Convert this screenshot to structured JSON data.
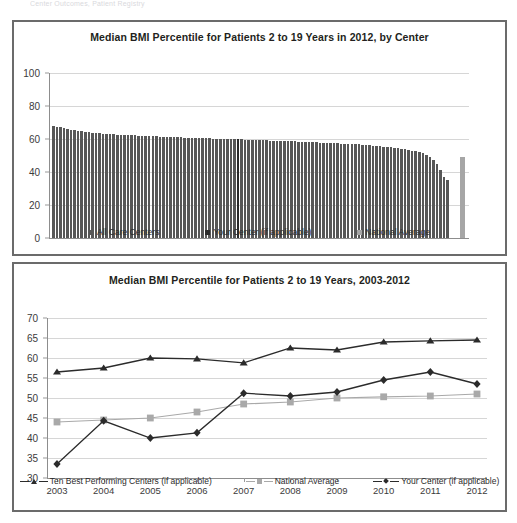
{
  "page": {
    "cut_header_text": "Center Outcomes, Patient Registry"
  },
  "panels": {
    "top": {
      "title": "Median BMI Percentile for Patients 2 to 19 Years in 2012, by Center",
      "legend": [
        {
          "label": "All Care Centers",
          "color": "#575757",
          "key": "all"
        },
        {
          "label": "Your Center (if applicable)",
          "color": "#2a2a2a",
          "key": "you"
        },
        {
          "label": "National Average",
          "color": "#a6a6a6",
          "key": "natl"
        }
      ]
    },
    "bottom": {
      "title": "Median BMI Percentile for Patients 2 to 19 Years, 2003-2012",
      "legend": [
        {
          "label": "Ten Best Performing Centers (if applicable)",
          "marker": "triangle",
          "color": "#2b2b2b"
        },
        {
          "label": "National Average",
          "marker": "square",
          "color": "#a9a9a9"
        },
        {
          "label": "Your Center (if applicable)",
          "marker": "diamond",
          "color": "#2b2b2b"
        }
      ]
    }
  },
  "chart_data": [
    {
      "type": "bar",
      "title": "Median BMI Percentile for Patients 2 to 19 Years in 2012, by Center",
      "xlabel": "",
      "ylabel": "",
      "ylim": [
        0,
        100
      ],
      "yticks": [
        0,
        20,
        40,
        60,
        80,
        100
      ],
      "grid": true,
      "legend_position": "bottom",
      "series": [
        {
          "name": "All Care Centers",
          "color": "#575757"
        },
        {
          "name": "Your Center (if applicable)",
          "color": "#2a2a2a"
        },
        {
          "name": "National Average",
          "color": "#a6a6a6"
        }
      ],
      "your_center_index": 52,
      "national_average_value": 49,
      "values": [
        68,
        67.5,
        67,
        66.5,
        66,
        65.5,
        65.2,
        65,
        64.6,
        64.3,
        64,
        63.8,
        63.5,
        63.4,
        63.2,
        63,
        62.9,
        62.8,
        62.7,
        62.6,
        62.5,
        62.4,
        62.3,
        62.2,
        62.1,
        62,
        61.9,
        61.8,
        61.7,
        61.6,
        61.5,
        61.4,
        61.3,
        61.2,
        61.1,
        61,
        61,
        60.9,
        60.8,
        60.8,
        60.7,
        60.6,
        60.5,
        60.5,
        60.4,
        60.3,
        60.3,
        60.2,
        60.1,
        60,
        60,
        59.9,
        59.8,
        59.8,
        59.7,
        59.6,
        59.5,
        59.5,
        59.4,
        59.3,
        59.2,
        59.1,
        59,
        59,
        58.9,
        58.8,
        58.7,
        58.6,
        58.5,
        58.4,
        58.3,
        58.2,
        58.1,
        58,
        57.9,
        57.8,
        57.7,
        57.6,
        57.5,
        57.4,
        57.3,
        57.2,
        57.1,
        57,
        56.9,
        56.8,
        56.7,
        56.5,
        56.4,
        56.2,
        56,
        55.8,
        55.6,
        55.4,
        55.2,
        55,
        54.7,
        54.4,
        54.1,
        53.8,
        53.4,
        53,
        52.5,
        52,
        51.3,
        50.4,
        49.2,
        47.5,
        45,
        41,
        37,
        35
      ]
    },
    {
      "type": "line",
      "title": "Median BMI Percentile for Patients 2 to 19 Years, 2003-2012",
      "xlabel": "",
      "ylabel": "",
      "x": [
        2003,
        2004,
        2005,
        2006,
        2007,
        2008,
        2009,
        2010,
        2011,
        2012
      ],
      "ylim": [
        30,
        70
      ],
      "yticks": [
        30,
        35,
        40,
        45,
        50,
        55,
        60,
        65,
        70
      ],
      "grid": true,
      "legend_position": "bottom",
      "series": [
        {
          "name": "Ten Best Performing Centers (if applicable)",
          "marker": "triangle",
          "color": "#2b2b2b",
          "values": [
            56.5,
            57.5,
            60,
            59.8,
            58.8,
            62.5,
            62,
            64,
            64.3,
            64.5
          ]
        },
        {
          "name": "National Average",
          "marker": "square",
          "color": "#a9a9a9",
          "values": [
            44,
            44.5,
            45,
            46.5,
            48.5,
            49,
            50,
            50.3,
            50.5,
            51
          ]
        },
        {
          "name": "Your Center (if applicable)",
          "marker": "diamond",
          "color": "#2b2b2b",
          "values": [
            33.5,
            44.3,
            40,
            41.3,
            51.2,
            50.5,
            51.5,
            54.5,
            56.5,
            53.5
          ]
        }
      ]
    }
  ]
}
